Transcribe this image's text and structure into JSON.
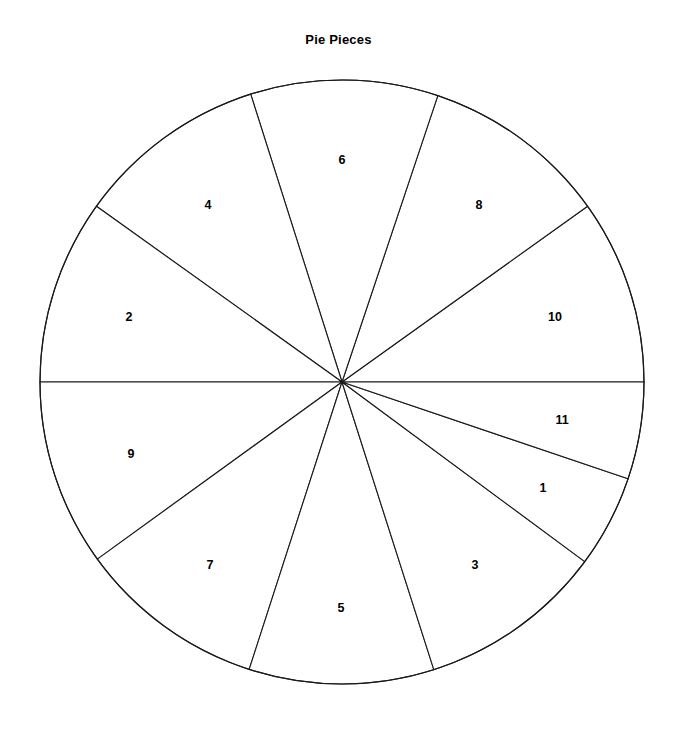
{
  "chart_data": {
    "type": "pie",
    "title": "Pie Pieces",
    "xlabel": "",
    "ylabel": "",
    "legend": "none",
    "grid": false,
    "start_angle_deg": 0,
    "direction": "counterclockwise",
    "center": {
      "x": 342,
      "y": 382
    },
    "radius": 302,
    "total_degrees": 360,
    "labels": [
      "10",
      "8",
      "6",
      "4",
      "2",
      "9",
      "7",
      "5",
      "3",
      "1",
      "11"
    ],
    "values": [
      35.6,
      35.9,
      36.1,
      36.8,
      35.6,
      35.9,
      36.2,
      35.6,
      35.8,
      17.8,
      18.7
    ],
    "slices": [
      {
        "label": "10",
        "start_deg": 0.0,
        "end_deg": 35.6,
        "sweep_deg": 35.6,
        "label_x": 555,
        "label_y": 318
      },
      {
        "label": "8",
        "start_deg": 35.6,
        "end_deg": 71.5,
        "sweep_deg": 35.9,
        "label_x": 479,
        "label_y": 206
      },
      {
        "label": "6",
        "start_deg": 71.5,
        "end_deg": 107.6,
        "sweep_deg": 36.1,
        "label_x": 342,
        "label_y": 161
      },
      {
        "label": "4",
        "start_deg": 107.6,
        "end_deg": 144.4,
        "sweep_deg": 36.8,
        "label_x": 208,
        "label_y": 206
      },
      {
        "label": "2",
        "start_deg": 144.4,
        "end_deg": 180.0,
        "sweep_deg": 35.6,
        "label_x": 129,
        "label_y": 318
      },
      {
        "label": "9",
        "start_deg": 180.0,
        "end_deg": 215.9,
        "sweep_deg": 35.9,
        "label_x": 131,
        "label_y": 455
      },
      {
        "label": "7",
        "start_deg": 215.9,
        "end_deg": 252.1,
        "sweep_deg": 36.2,
        "label_x": 210,
        "label_y": 566
      },
      {
        "label": "5",
        "start_deg": 252.1,
        "end_deg": 287.7,
        "sweep_deg": 35.6,
        "label_x": 341,
        "label_y": 609
      },
      {
        "label": "3",
        "start_deg": 287.7,
        "end_deg": 323.5,
        "sweep_deg": 35.8,
        "label_x": 475,
        "label_y": 566
      },
      {
        "label": "1",
        "start_deg": 323.5,
        "end_deg": 341.3,
        "sweep_deg": 17.8,
        "label_x": 543,
        "label_y": 489
      },
      {
        "label": "11",
        "start_deg": 341.3,
        "end_deg": 360.0,
        "sweep_deg": 18.7,
        "label_x": 562,
        "label_y": 421
      }
    ],
    "colors": {
      "slice_fill": "#ffffff",
      "slice_stroke": "#1a1a1a",
      "label_text": "#000000",
      "title_text": "#000000",
      "background": "#ffffff"
    }
  }
}
